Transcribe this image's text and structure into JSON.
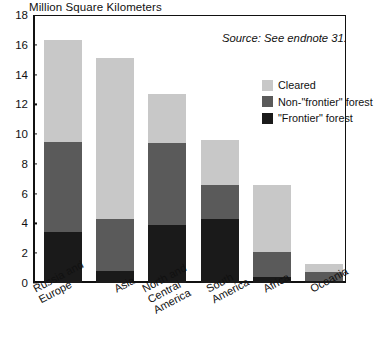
{
  "chart_data": {
    "type": "bar",
    "subtype": "stacked-vertical",
    "title": "Million Square Kilometers",
    "xlabel": "",
    "ylabel": "Million Square Kilometers",
    "ylim": [
      0,
      18
    ],
    "ytick_step": 2,
    "yticks": [
      "0",
      "2",
      "4",
      "6",
      "8",
      "10",
      "12",
      "14",
      "16",
      "18"
    ],
    "grid": false,
    "legend_position": "inside-top-right",
    "categories": [
      "Russia and\nEurope",
      "Asia",
      "North and\nCentral\nAmerica",
      "South\nAmerica",
      "Africa",
      "Oceania"
    ],
    "series": [
      {
        "name": "\"Frontier\" forest",
        "color": "#1a1a1a",
        "values": [
          3.4,
          0.8,
          3.9,
          4.3,
          0.4,
          0.15
        ]
      },
      {
        "name": "Non-\"frontier\" forest",
        "color": "#5a5a5a",
        "values": [
          6.1,
          3.5,
          5.5,
          2.3,
          1.7,
          0.6
        ]
      },
      {
        "name": "Cleared",
        "color": "#c8c8c8",
        "values": [
          6.8,
          10.8,
          3.3,
          3.0,
          4.5,
          0.55
        ]
      }
    ],
    "totals": [
      16.3,
      15.1,
      12.7,
      9.6,
      6.6,
      1.3
    ],
    "annotations": [
      {
        "text": "Source: See endnote 31.",
        "style": "italic",
        "position": "top-right"
      }
    ]
  },
  "legend": {
    "items": [
      {
        "label": "Cleared",
        "color": "#c8c8c8"
      },
      {
        "label": "Non-\"frontier\" forest",
        "color": "#5a5a5a"
      },
      {
        "label": "\"Frontier\" forest",
        "color": "#1a1a1a"
      }
    ]
  },
  "source_note": "Source: See endnote 31."
}
